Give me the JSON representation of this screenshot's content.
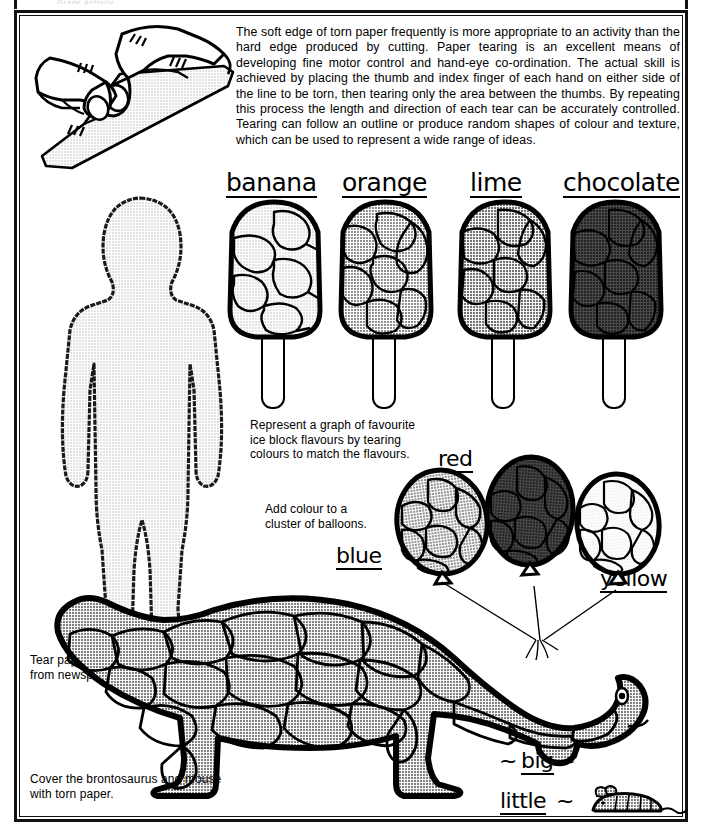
{
  "page": {
    "title": "Torn Paper",
    "ghost_header": "Grade  Activity",
    "border_color": "#111111",
    "background": "#ffffff"
  },
  "intro": {
    "paragraph": "The soft edge of torn paper frequently is more appropriate to an activity than the hard edge produced by cutting. Paper tearing is an excellent means of developing fine motor control and hand-eye co-ordination. The actual skill is achieved by placing the thumb and index finger of each hand on either side of the line to be torn, then tearing only the area between the thumbs. By repeating this process the length and direction of each tear can be accurately controlled. Tearing can follow an outline or produce random shapes of colour and texture, which can be used to represent a wide range of ideas."
  },
  "hand_illustration": {
    "name": "hands-tearing-paper",
    "alt": "Two hands tearing a sheet of paper"
  },
  "paper_doll": {
    "caption": "Tear paper people on the fold from newspaper or gift wrap.",
    "fill": "#d9d9d9"
  },
  "ice_blocks": {
    "caption": "Represent a graph of favourite ice block flavours by tearing colours to match the flavours.",
    "items": [
      {
        "label": "banana",
        "fill": "#d9d9d9"
      },
      {
        "label": "orange",
        "fill": "#c2c2c2"
      },
      {
        "label": "lime",
        "fill": "#9a9a9a"
      },
      {
        "label": "chocolate",
        "fill": "#585858"
      }
    ]
  },
  "balloons": {
    "caption": "Add colour to a cluster of balloons.",
    "items": [
      {
        "label": "blue",
        "fill": "#a8a8a8"
      },
      {
        "label": "red",
        "fill": "#6a6a6a"
      },
      {
        "label": "yellow",
        "fill": "#e0e0e0"
      }
    ]
  },
  "dinosaur": {
    "caption": "Cover the brontosaurus and mouse with torn paper.",
    "big_label": "big",
    "little_label": "little",
    "tilde": "~",
    "fill": "#8f8f8f"
  }
}
